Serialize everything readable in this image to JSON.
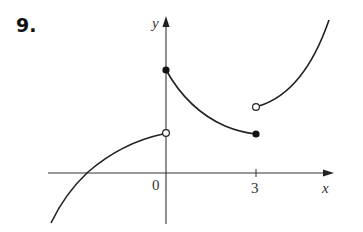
{
  "problem_number": "9.",
  "axes": {
    "x_label": "x",
    "y_label": "y",
    "origin_label": "0",
    "x_ticks": [
      "3"
    ]
  },
  "graph": {
    "pieces": [
      {
        "domain": "x < 0",
        "left_end": "curve continues downward",
        "right_end": "open circle at x=0 (lower value)"
      },
      {
        "domain": "0 <= x <= 3",
        "left_end": "filled circle at x=0 (higher value)",
        "right_end": "filled circle at x=3"
      },
      {
        "domain": "x > 3",
        "left_end": "open circle at x=3",
        "right_end": "curve increases upward"
      }
    ]
  },
  "colors": {
    "curve": "#222222",
    "axis": "#333333"
  }
}
